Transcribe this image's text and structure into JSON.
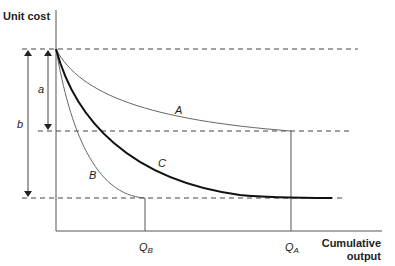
{
  "diagram": {
    "y_axis_label": "Unit cost",
    "x_axis_label_line1": "Cumulative",
    "x_axis_label_line2": "output",
    "curves": [
      {
        "name": "A",
        "label": "A"
      },
      {
        "name": "B",
        "label": "B"
      },
      {
        "name": "C",
        "label": "C"
      }
    ],
    "dimension_labels": {
      "a": "a",
      "b": "b"
    },
    "x_markers": {
      "qb": "Q",
      "qb_sub": "B",
      "qa": "Q",
      "qa_sub": "A"
    },
    "colors": {
      "axis": "#555555",
      "thin_curve": "#666666",
      "thick_curve": "#111111",
      "dashed": "#444444"
    }
  }
}
